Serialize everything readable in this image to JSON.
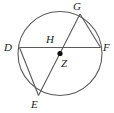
{
  "figure": {
    "name": "circle-with-inscribed-chords",
    "background_color": "#ffffff",
    "stroke_color": "#5a5a5a",
    "label_color": "#1a1a1a",
    "center_dot_color": "#111111",
    "circle": {
      "cx": 60,
      "cy": 53.5,
      "r": 42
    },
    "labels": {
      "D": "D",
      "E": "E",
      "F": "F",
      "G": "G",
      "H": "H",
      "Z": "Z"
    },
    "points": [
      {
        "id": "D",
        "label": "D",
        "x": 19.5,
        "y": 47.5,
        "on_circle": true,
        "label_x": 4,
        "label_y": 51
      },
      {
        "id": "E",
        "label": "E",
        "x": 38.5,
        "y": 95.5,
        "on_circle": true,
        "label_x": 31,
        "label_y": 108
      },
      {
        "id": "F",
        "label": "F",
        "x": 100.5,
        "y": 47.5,
        "on_circle": true,
        "label_x": 102,
        "label_y": 51
      },
      {
        "id": "G",
        "label": "G",
        "x": 80.0,
        "y": 14.0,
        "on_circle": true,
        "label_x": 73,
        "label_y": 9
      },
      {
        "id": "H",
        "label": "H",
        "x": 55.0,
        "y": 47.5,
        "on_circle": false,
        "label_x": 47,
        "label_y": 42
      },
      {
        "id": "Z",
        "label": "Z",
        "x": 60.0,
        "y": 53.5,
        "on_circle": false,
        "label_x": 62,
        "label_y": 66,
        "is_center": true
      }
    ],
    "chords": [
      {
        "id": "DF",
        "from": "D",
        "to": "F"
      },
      {
        "id": "EG",
        "from": "E",
        "to": "G"
      },
      {
        "id": "DE",
        "from": "D",
        "to": "E"
      },
      {
        "id": "GF",
        "from": "G",
        "to": "F"
      }
    ]
  }
}
